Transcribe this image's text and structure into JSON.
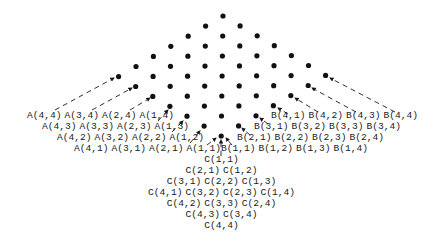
{
  "diagram": {
    "colors": {
      "ink": "#111111",
      "background": "#ffffff"
    },
    "lattice": {
      "size": 7,
      "top": [
        223,
        16
      ],
      "step_down_left": [
        -17.4,
        10.1
      ],
      "step_down_right": [
        17.1,
        9.9
      ],
      "dot_radius": 2.6
    },
    "label_rows": {
      "A": [
        [
          "A(4,4)",
          "A(3,4)",
          "A(2,4)",
          "A(1,4)"
        ],
        [
          "A(4,3)",
          "A(3,3)",
          "A(2,3)",
          "A(1,3)"
        ],
        [
          "A(4,2)",
          "A(3,2)",
          "A(2,2)",
          "A(1,2)"
        ],
        [
          "A(4,1)",
          "A(3,1)",
          "A(2,1)",
          "A(1,1)"
        ]
      ],
      "B": [
        [
          "B(4,1)",
          "B(4,2)",
          "B(4,3)",
          "B(4,4)"
        ],
        [
          "B(3,1)",
          "B(3,2)",
          "B(3,3)",
          "B(3,4)"
        ],
        [
          "B(2,1)",
          "B(2,2)",
          "B(2,3)",
          "B(2,4)"
        ],
        [
          "B(1,1)",
          "B(1,2)",
          "B(1,3)",
          "B(1,4)"
        ]
      ],
      "C": [
        [
          "C(1,1)"
        ],
        [
          "C(2,1)",
          "C(1,2)"
        ],
        [
          "C(3,1)",
          "C(2,2)",
          "C(1,3)"
        ],
        [
          "C(4,1)",
          "C(3,2)",
          "C(2,3)",
          "C(1,4)"
        ],
        [
          "C(4,2)",
          "C(3,3)",
          "C(2,4)"
        ],
        [
          "C(4,3)",
          "C(3,4)"
        ],
        [
          "C(4,4)"
        ]
      ]
    },
    "label_layout": {
      "A_row_start_x": [
        27,
        42,
        57,
        74
      ],
      "A_row_y": [
        118,
        129,
        140,
        151
      ],
      "B_row_start_x": [
        271,
        254,
        237,
        221
      ],
      "B_row_y": [
        118,
        129,
        140,
        151
      ],
      "C_center_x": 221,
      "C_row_y": [
        162,
        173,
        184,
        195,
        206,
        217,
        228
      ],
      "label_pitch": 37.5
    },
    "arrows": [
      {
        "from": [
          55,
          110
        ],
        "to": [
          114,
          78
        ],
        "family": "A",
        "row": 0
      },
      {
        "from": [
          92,
          110
        ],
        "to": [
          132,
          88
        ],
        "family": "A",
        "row": 0
      },
      {
        "from": [
          130,
          110
        ],
        "to": [
          150,
          98
        ],
        "family": "A",
        "row": 0
      },
      {
        "from": [
          158,
          121
        ],
        "to": [
          168,
          110
        ],
        "family": "A",
        "row": 1
      },
      {
        "from": [
          172,
          132
        ],
        "to": [
          183,
          121
        ],
        "family": "A",
        "row": 2
      },
      {
        "from": [
          190,
          143
        ],
        "to": [
          200,
          131
        ],
        "family": "A",
        "row": 3
      },
      {
        "from": [
          207,
          145
        ],
        "to": [
          216,
          138
        ],
        "family": "A",
        "row": 3
      },
      {
        "from": [
          395,
          112
        ],
        "to": [
          330,
          78
        ],
        "family": "B",
        "row": 0
      },
      {
        "from": [
          356,
          112
        ],
        "to": [
          312,
          88
        ],
        "family": "B",
        "row": 0
      },
      {
        "from": [
          318,
          112
        ],
        "to": [
          295,
          98
        ],
        "family": "B",
        "row": 0
      },
      {
        "from": [
          288,
          114
        ],
        "to": [
          278,
          108
        ],
        "family": "B",
        "row": 0
      },
      {
        "from": [
          268,
          124
        ],
        "to": [
          260,
          118
        ],
        "family": "B",
        "row": 1
      },
      {
        "from": [
          250,
          135
        ],
        "to": [
          242,
          128
        ],
        "family": "B",
        "row": 2
      },
      {
        "from": [
          232,
          145
        ],
        "to": [
          226,
          138
        ],
        "family": "B",
        "row": 3
      },
      {
        "from": [
          221,
          156
        ],
        "to": [
          221,
          140
        ],
        "family": "C",
        "row": 0
      }
    ]
  }
}
